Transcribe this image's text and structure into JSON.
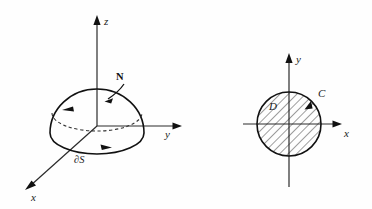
{
  "figure": {
    "background_color": "#fefefe",
    "ink_color": "#111111"
  },
  "left_panel": {
    "name": "hemisphere-surface-diagram",
    "axes": [
      {
        "id": "z",
        "label": "z",
        "direction": "up"
      },
      {
        "id": "y",
        "label": "y",
        "direction": "right"
      },
      {
        "id": "x",
        "label": "x",
        "direction": "down-left"
      }
    ],
    "labels": {
      "normal_vector": "N",
      "boundary_curve": "∂S"
    },
    "annotations": {
      "normal_arrow": "outward unit normal arrow on the cap",
      "boundary_arrow": "counterclockwise orientation arrow on front boundary",
      "hidden_arc": "dashed back half of the boundary ellipse with arrow"
    }
  },
  "right_panel": {
    "name": "disk-region-diagram",
    "axes": [
      {
        "id": "y",
        "label": "y",
        "direction": "up"
      },
      {
        "id": "x",
        "label": "x",
        "direction": "right"
      }
    ],
    "labels": {
      "region": "D",
      "boundary_curve": "C"
    },
    "annotations": {
      "fill": "diagonal hatching from lower-left to upper-right",
      "orientation_arrow": "counterclockwise arrow on circle near upper right"
    }
  }
}
